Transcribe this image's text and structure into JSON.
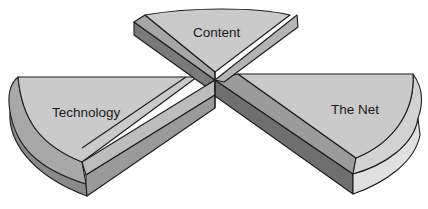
{
  "diagram": {
    "title": "",
    "segments": [
      {
        "id": "content",
        "label": "Content"
      },
      {
        "id": "technology",
        "label": "Technology"
      },
      {
        "id": "the-net",
        "label": "The Net"
      }
    ],
    "colors": {
      "top_face": "#c9c9c9",
      "side_light": "#a9a9a9",
      "side_mid": "#8e8e8e",
      "side_dark": "#6e6e6e",
      "rim_light": "#dcdcdc",
      "outline": "#1c1c1c"
    }
  }
}
